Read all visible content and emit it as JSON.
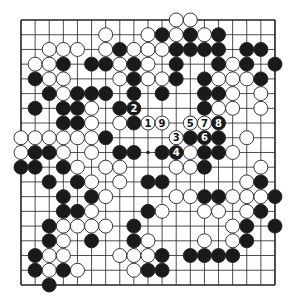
{
  "diagram": {
    "type": "go-board",
    "size": 19,
    "colors": {
      "background": "#ffffff",
      "line": "#222222",
      "black_stone": "#1a1a1a",
      "white_stone": "#ffffff",
      "stone_outline": "#222222"
    },
    "geometry": {
      "x0": 21,
      "y0": 20,
      "dx": 14.11,
      "dy": 14.72,
      "stone_r": 7
    },
    "hoshi": [
      [
        3,
        3
      ],
      [
        9,
        3
      ],
      [
        15,
        3
      ],
      [
        3,
        9
      ],
      [
        9,
        9
      ],
      [
        15,
        9
      ],
      [
        3,
        15
      ],
      [
        9,
        15
      ],
      [
        15,
        15
      ]
    ],
    "stones": {
      "white": [
        [
          11,
          0
        ],
        [
          12,
          0
        ],
        [
          6,
          1
        ],
        [
          9,
          1
        ],
        [
          11,
          1
        ],
        [
          13,
          1
        ],
        [
          2,
          2
        ],
        [
          3,
          2
        ],
        [
          4,
          2
        ],
        [
          6,
          2
        ],
        [
          8,
          2
        ],
        [
          9,
          2
        ],
        [
          10,
          2
        ],
        [
          1,
          3
        ],
        [
          2,
          3
        ],
        [
          7,
          3
        ],
        [
          9,
          3
        ],
        [
          15,
          3
        ],
        [
          2,
          4
        ],
        [
          3,
          4
        ],
        [
          7,
          4
        ],
        [
          9,
          4
        ],
        [
          10,
          4
        ],
        [
          14,
          4
        ],
        [
          15,
          4
        ],
        [
          16,
          4
        ],
        [
          3,
          5
        ],
        [
          15,
          5
        ],
        [
          17,
          5
        ],
        [
          5,
          6
        ],
        [
          14,
          6
        ],
        [
          15,
          6
        ],
        [
          17,
          6
        ],
        [
          5,
          7
        ],
        [
          7,
          7
        ],
        [
          0,
          8
        ],
        [
          1,
          8
        ],
        [
          2,
          8
        ],
        [
          3,
          8
        ],
        [
          4,
          8
        ],
        [
          5,
          8
        ],
        [
          16,
          8
        ],
        [
          0,
          9
        ],
        [
          3,
          9
        ],
        [
          5,
          9
        ],
        [
          12,
          9
        ],
        [
          15,
          9
        ],
        [
          4,
          10
        ],
        [
          6,
          10
        ],
        [
          7,
          10
        ],
        [
          11,
          10
        ],
        [
          12,
          10
        ],
        [
          17,
          10
        ],
        [
          5,
          11
        ],
        [
          7,
          11
        ],
        [
          16,
          11
        ],
        [
          6,
          12
        ],
        [
          11,
          12
        ],
        [
          12,
          12
        ],
        [
          15,
          12
        ],
        [
          16,
          12
        ],
        [
          17,
          12
        ],
        [
          5,
          13
        ],
        [
          10,
          13
        ],
        [
          13,
          13
        ],
        [
          14,
          13
        ],
        [
          16,
          13
        ],
        [
          3,
          14
        ],
        [
          4,
          14
        ],
        [
          5,
          14
        ],
        [
          6,
          14
        ],
        [
          15,
          14
        ],
        [
          3,
          15
        ],
        [
          9,
          15
        ],
        [
          13,
          15
        ],
        [
          15,
          15
        ],
        [
          2,
          16
        ],
        [
          3,
          16
        ],
        [
          7,
          16
        ],
        [
          8,
          16
        ],
        [
          9,
          16
        ],
        [
          2,
          17
        ],
        [
          4,
          17
        ],
        [
          8,
          17
        ]
      ],
      "black": [
        [
          10,
          1
        ],
        [
          12,
          1
        ],
        [
          14,
          1
        ],
        [
          7,
          2
        ],
        [
          11,
          2
        ],
        [
          12,
          2
        ],
        [
          13,
          2
        ],
        [
          14,
          2
        ],
        [
          16,
          2
        ],
        [
          17,
          2
        ],
        [
          3,
          3
        ],
        [
          5,
          3
        ],
        [
          6,
          3
        ],
        [
          8,
          3
        ],
        [
          11,
          3
        ],
        [
          14,
          3
        ],
        [
          16,
          3
        ],
        [
          18,
          3
        ],
        [
          1,
          4
        ],
        [
          8,
          4
        ],
        [
          11,
          4
        ],
        [
          13,
          4
        ],
        [
          17,
          4
        ],
        [
          2,
          5
        ],
        [
          4,
          5
        ],
        [
          5,
          5
        ],
        [
          6,
          5
        ],
        [
          8,
          5
        ],
        [
          10,
          5
        ],
        [
          13,
          5
        ],
        [
          14,
          5
        ],
        [
          1,
          6
        ],
        [
          3,
          6
        ],
        [
          4,
          6
        ],
        [
          7,
          6
        ],
        [
          13,
          6
        ],
        [
          3,
          7
        ],
        [
          4,
          7
        ],
        [
          8,
          7
        ],
        [
          6,
          8
        ],
        [
          12,
          8
        ],
        [
          14,
          8
        ],
        [
          1,
          9
        ],
        [
          2,
          9
        ],
        [
          7,
          9
        ],
        [
          8,
          9
        ],
        [
          10,
          9
        ],
        [
          13,
          9
        ],
        [
          14,
          9
        ],
        [
          0,
          10
        ],
        [
          1,
          10
        ],
        [
          3,
          10
        ],
        [
          13,
          10
        ],
        [
          2,
          11
        ],
        [
          4,
          11
        ],
        [
          9,
          11
        ],
        [
          10,
          11
        ],
        [
          17,
          11
        ],
        [
          3,
          12
        ],
        [
          5,
          12
        ],
        [
          13,
          12
        ],
        [
          14,
          12
        ],
        [
          18,
          12
        ],
        [
          3,
          13
        ],
        [
          4,
          13
        ],
        [
          9,
          13
        ],
        [
          17,
          13
        ],
        [
          2,
          14
        ],
        [
          8,
          14
        ],
        [
          16,
          14
        ],
        [
          18,
          14
        ],
        [
          2,
          15
        ],
        [
          5,
          15
        ],
        [
          8,
          15
        ],
        [
          16,
          15
        ],
        [
          1,
          16
        ],
        [
          10,
          16
        ],
        [
          12,
          16
        ],
        [
          13,
          16
        ],
        [
          14,
          16
        ],
        [
          15,
          16
        ],
        [
          1,
          17
        ],
        [
          3,
          17
        ],
        [
          9,
          17
        ],
        [
          10,
          17
        ],
        [
          2,
          18
        ]
      ]
    },
    "numbered_moves": [
      {
        "label": "1",
        "color": "white",
        "pos": [
          9,
          7
        ]
      },
      {
        "label": "2",
        "color": "black",
        "pos": [
          8,
          6
        ]
      },
      {
        "label": "3",
        "color": "white",
        "pos": [
          11,
          8
        ]
      },
      {
        "label": "4",
        "color": "black",
        "pos": [
          11,
          9
        ]
      },
      {
        "label": "5",
        "color": "white",
        "pos": [
          12,
          7
        ]
      },
      {
        "label": "6",
        "color": "black",
        "pos": [
          13,
          8
        ]
      },
      {
        "label": "7",
        "color": "white",
        "pos": [
          13,
          7
        ]
      },
      {
        "label": "8",
        "color": "black",
        "pos": [
          14,
          7
        ]
      },
      {
        "label": "9",
        "color": "white",
        "pos": [
          10,
          7
        ]
      }
    ]
  }
}
